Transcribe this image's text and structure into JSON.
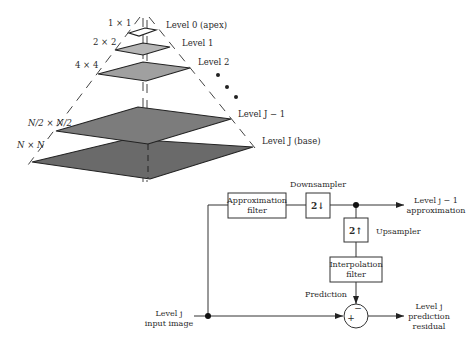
{
  "pyramid": {
    "size_labels": [
      "1 × 1",
      "2 × 2",
      "4 × 4",
      "N/2 × N/2",
      "N × N"
    ],
    "level_labels": [
      "Level 0 (apex)",
      "Level 1",
      "Level 2",
      "Level J − 1",
      "Level J (base)"
    ],
    "colors": {
      "level0": "#ffffff",
      "level1": "#b4b4b4",
      "level2": "#9e9e9e",
      "levelJm1": "#7a7a7a",
      "levelJ": "#6a6a6a"
    }
  },
  "block_diagram": {
    "approx_filter": [
      "Approximation",
      "filter"
    ],
    "downsampler_box": "2↓",
    "downsampler_label": "Downsampler",
    "upsampler_box": "2↑",
    "upsampler_label": "Upsampler",
    "interp_filter": [
      "Interpolation",
      "filter"
    ],
    "prediction_label": "Prediction",
    "input_label": [
      "Level j",
      "input image"
    ],
    "output_approx": [
      "Level j − 1",
      "approximation"
    ],
    "output_residual": [
      "Level j",
      "prediction",
      "residual"
    ],
    "sum_plus": "+",
    "sum_minus": "−"
  }
}
